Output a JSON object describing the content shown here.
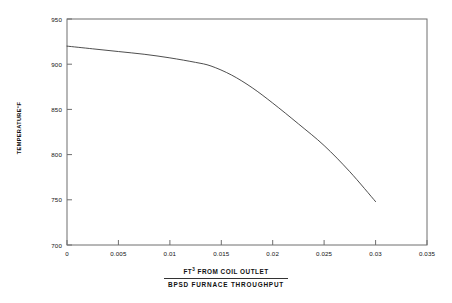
{
  "chart_data": {
    "type": "line",
    "title": "",
    "subtitle": "",
    "xlabel_numerator": "FT³ FROM COIL OUTLET",
    "xlabel_denominator": "BPSD  FURNACE THROUGHPUT",
    "ylabel": "TEMPERATURE °F",
    "xlim": [
      0,
      0.035
    ],
    "ylim": [
      700,
      950
    ],
    "grid": false,
    "legend": false,
    "xticks": [
      0,
      0.005,
      0.01,
      0.015,
      0.02,
      0.025,
      0.03,
      0.035
    ],
    "xtick_labels": [
      "0",
      "0.005",
      "0.01",
      "0.015",
      "0.02",
      "0.025",
      "0.03",
      "0.035"
    ],
    "yticks": [
      700,
      750,
      800,
      850,
      900,
      950
    ],
    "ytick_labels": [
      "700",
      "750",
      "800",
      "850",
      "900",
      "950"
    ],
    "series": [
      {
        "name": "coil outlet temperature",
        "color": "#3a3a3a",
        "x": [
          0,
          0.0025,
          0.005,
          0.0075,
          0.01,
          0.0125,
          0.014,
          0.016,
          0.018,
          0.02,
          0.0225,
          0.025,
          0.0275,
          0.03
        ],
        "y": [
          920,
          917,
          914,
          911,
          907,
          902,
          898,
          888,
          874,
          857,
          834,
          810,
          781,
          748
        ]
      }
    ]
  },
  "axes": {
    "ylabel_text": "TEMPERATURE",
    "ylabel_unit": "°F"
  }
}
